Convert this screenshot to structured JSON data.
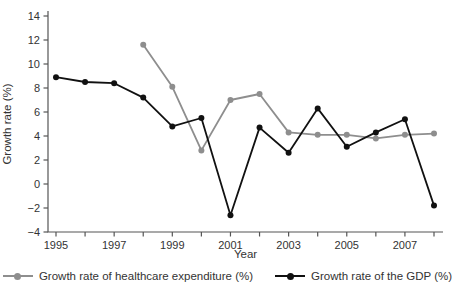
{
  "chart_data": {
    "type": "line",
    "title": "",
    "xlabel": "Year",
    "ylabel": "Growth rate (%)",
    "x": [
      1995,
      1996,
      1997,
      1998,
      1999,
      2000,
      2001,
      2002,
      2003,
      2004,
      2005,
      2006,
      2007,
      2008
    ],
    "x_tick_labels": [
      "1995",
      "1997",
      "1999",
      "2001",
      "2003",
      "2005",
      "2007"
    ],
    "yticks": [
      14,
      12,
      10,
      8,
      6,
      4,
      2,
      0,
      -2,
      -4
    ],
    "ylim": [
      -4,
      14
    ],
    "grid": false,
    "legend_position": "bottom",
    "axis_color": "#555555",
    "text_color": "#333333",
    "series": [
      {
        "name": "Growth rate of healthcare expenditure (%)",
        "color": "#8e8e8e",
        "values": [
          null,
          null,
          null,
          11.6,
          8.1,
          2.8,
          7.0,
          7.5,
          4.3,
          4.1,
          4.1,
          3.8,
          4.1,
          4.2
        ]
      },
      {
        "name": "Growth rate of the GDP (%)",
        "color": "#111111",
        "values": [
          8.9,
          8.5,
          8.4,
          7.2,
          4.8,
          5.5,
          -2.6,
          4.7,
          2.6,
          6.3,
          3.1,
          4.3,
          5.4,
          -1.8
        ]
      }
    ]
  }
}
